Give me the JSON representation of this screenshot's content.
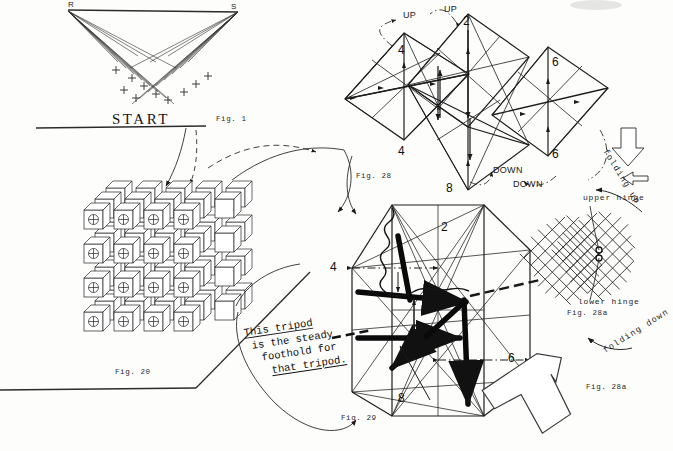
{
  "page": {
    "width": 673,
    "height": 451,
    "background": "#fdfdfc",
    "ink": "#161616"
  },
  "fig1": {
    "caption": "Fig. 1",
    "start_label": "START",
    "vertex_left": "R",
    "vertex_right": "S",
    "ray_count": 11,
    "description": "Two-point perspective ruled-line weave converging on points R and S"
  },
  "fig20": {
    "caption": "Fig. 20",
    "grid_cols": 5,
    "grid_rows": 5,
    "description": "Isometric stacked array of small cubes with circled-cross face markings"
  },
  "fig28": {
    "caption": "Fig. 28",
    "vertex_labels": [
      "4",
      "2",
      "6",
      "4",
      "6",
      "8"
    ],
    "motion_labels": [
      "UP",
      "UP",
      "DOWN",
      "DOWN"
    ],
    "description": "Chain of three linked octahedra with up/down folding arrows"
  },
  "fig29": {
    "caption": "Fig. 29",
    "vertex_labels": [
      "2",
      "4",
      "6",
      "8"
    ],
    "center_label": "8",
    "description": "Single octahedral cell in a box with heavy vector arrows showing the tripod"
  },
  "fig28a": {
    "caption_upper": "Fig. 28a",
    "caption_lower": "Fig. 28a",
    "upper_hinge_label": "upper hinge",
    "lower_hinge_label": "lower hinge",
    "folding_up_label": "folding up",
    "folding_down_label": "folding down",
    "description": "Two diamond-shaped grid meshes joined at an upper and lower hinge point"
  },
  "note": {
    "line1": "This tripod",
    "line2": "is the steady",
    "line3": "foothold for",
    "line4": "that tripod.",
    "underlined_words": [
      "This",
      "that"
    ]
  },
  "icons": {
    "hollow_arrow_bottom_right": "hollow-arrow-up-left-icon",
    "hollow_arrow_right_edge": "hollow-arrow-down-icon",
    "hollow_arrow_small_right": "hollow-arrow-left-icon"
  }
}
